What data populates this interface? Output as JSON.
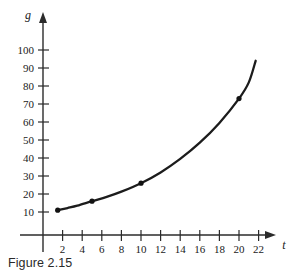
{
  "caption": "Figure 2.15",
  "chart_data": {
    "type": "line",
    "title": "",
    "xlabel": "t",
    "ylabel": "g",
    "xlim": [
      0,
      23.5
    ],
    "ylim": [
      0,
      105
    ],
    "grid": false,
    "legend": "none",
    "x_ticks": [
      2,
      4,
      6,
      8,
      10,
      12,
      14,
      16,
      18,
      20,
      22
    ],
    "y_ticks": [
      10,
      20,
      30,
      40,
      50,
      60,
      70,
      80,
      90,
      100
    ],
    "x_tick_labels": [
      "2",
      "4",
      "6",
      "8",
      "10",
      "12",
      "14",
      "16",
      "18",
      "20",
      "22"
    ],
    "y_tick_labels": [
      "10",
      "20",
      "30",
      "40",
      "50",
      "60",
      "70",
      "80",
      "90",
      "100"
    ],
    "series": [
      {
        "name": "g(t)",
        "marked_points": [
          {
            "x": 1.5,
            "y": 11
          },
          {
            "x": 5,
            "y": 16
          },
          {
            "x": 10,
            "y": 26
          },
          {
            "x": 20,
            "y": 73
          }
        ],
        "curve": [
          {
            "x": 1.5,
            "y": 11
          },
          {
            "x": 2.5,
            "y": 12.2
          },
          {
            "x": 3.5,
            "y": 13.5
          },
          {
            "x": 5,
            "y": 16
          },
          {
            "x": 6.5,
            "y": 18.4
          },
          {
            "x": 8,
            "y": 21.3
          },
          {
            "x": 10,
            "y": 26
          },
          {
            "x": 12,
            "y": 32
          },
          {
            "x": 14,
            "y": 39.5
          },
          {
            "x": 16,
            "y": 48.5
          },
          {
            "x": 18,
            "y": 59.5
          },
          {
            "x": 20,
            "y": 73
          },
          {
            "x": 21,
            "y": 82
          },
          {
            "x": 21.7,
            "y": 94
          }
        ]
      }
    ]
  }
}
